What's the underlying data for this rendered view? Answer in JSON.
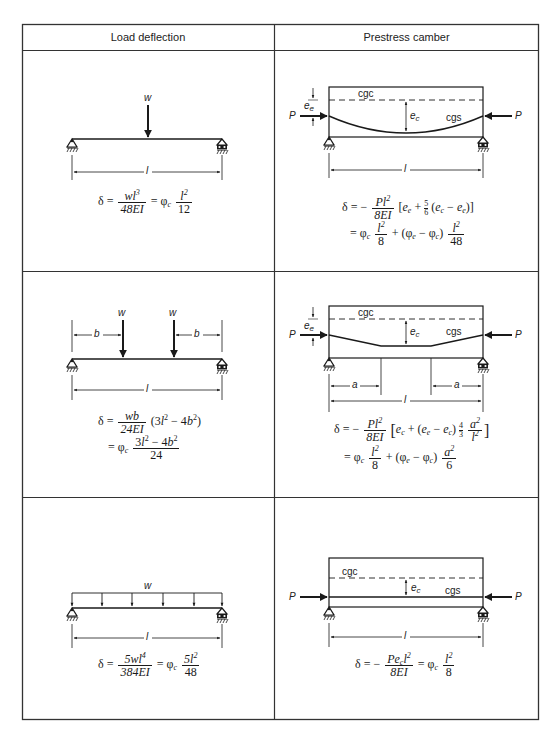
{
  "table": {
    "headers": [
      "Load deflection",
      "Prestress camber"
    ]
  },
  "rows": [
    {
      "load": {
        "case": "concentrated-load-at-midspan",
        "load_label": "w",
        "span_label": "l",
        "formula": {
          "lhs": "δ =",
          "frac1_num": "wl³",
          "frac1_den": "48EI",
          "eq": "= φc",
          "frac2_num": "l²",
          "frac2_den": "12"
        }
      },
      "camber": {
        "case": "parabolic-tendon",
        "cgc_label": "cgc",
        "cgs_label": "cgs",
        "ee_label": "e",
        "ee_sub": "e",
        "ec_label": "e",
        "ec_sub": "c",
        "force_label": "P",
        "span_label": "l",
        "formula_line1": "δ = − Pl²/8EI [ee + 5/6 (ec − ee)]",
        "formula_line2": "= φc l²/8 + (φe − φc) l²/48"
      }
    },
    {
      "load": {
        "case": "two-point-loads",
        "load_label": "w",
        "offset_label": "b",
        "span_label": "l",
        "formula_line1": "δ = wb/24EI (3l² − 4b²)",
        "formula_line2": "= φc (3l² − 4b²)/24"
      },
      "camber": {
        "case": "harped-tendon-two-points",
        "cgc_label": "cgc",
        "cgs_label": "cgs",
        "ee_label": "e",
        "ee_sub": "e",
        "ec_label": "e",
        "ec_sub": "c",
        "force_label": "P",
        "offset_label": "a",
        "span_label": "l",
        "formula_line1": "δ = − Pl²/8EI [ec + (ee − ec) 4/3 a²/l²]",
        "formula_line2": "= φc l²/8 + (φe − φc) a²/6"
      }
    },
    {
      "load": {
        "case": "uniform-load",
        "load_label": "w",
        "span_label": "l",
        "formula": {
          "lhs": "δ =",
          "frac1_num": "5wl⁴",
          "frac1_den": "384EI",
          "eq": "= φc",
          "frac2_num": "5l²",
          "frac2_den": "48"
        }
      },
      "camber": {
        "case": "straight-tendon",
        "cgc_label": "cgc",
        "cgs_label": "cgs",
        "ec_label": "e",
        "ec_sub": "c",
        "force_label": "P",
        "span_label": "l",
        "formula": {
          "lhs": "δ = −",
          "frac1_num": "Pecl²",
          "frac1_den": "8EI",
          "eq": "= φc",
          "frac2_num": "l²",
          "frac2_den": "8"
        }
      }
    }
  ],
  "text": {
    "w": "w",
    "l": "l",
    "b": "b",
    "a": "a",
    "P": "P",
    "cgc": "cgc",
    "cgs": "cgs",
    "e": "e",
    "sub_e": "e",
    "sub_c": "c",
    "delta_eq": "δ =",
    "delta_eq_neg": "δ = −",
    "eq": "=",
    "phi": "φ",
    "plus": "+",
    "minus": "−",
    "n_wl3": "wl",
    "n_48EI": "48EI",
    "n_12": "12",
    "n_l": "l",
    "n_2": "2",
    "n_3": "3",
    "n_4": "4",
    "n_Pl": "Pl",
    "n_8EI": "8EI",
    "n_8": "8",
    "n_48": "48",
    "n_5": "5",
    "n_6": "6",
    "n_wb": "wb",
    "n_24EI": "24EI",
    "n_24": "24",
    "n_3l2m4b2_a": "(3l",
    "n_b2": "b",
    "n_5wl4": "5wl",
    "n_384EI": "384EI",
    "n_5l": "5l",
    "n_Pe": "Pe",
    "n_a": "a",
    "lb": "[",
    "rb": "]"
  },
  "colors": {
    "ink": "#1a1a1a",
    "border": "#333333",
    "background": "#ffffff"
  }
}
